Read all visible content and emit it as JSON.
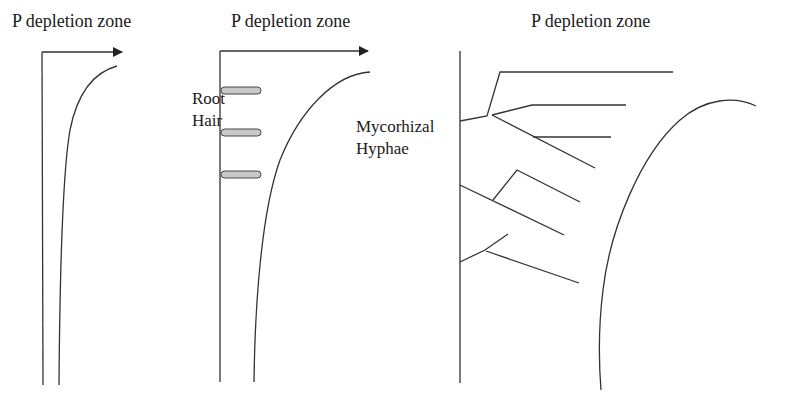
{
  "panels": [
    {
      "title": "P depletion zone",
      "side_label": []
    },
    {
      "title": "P depletion zone",
      "side_label": [
        "Root",
        "Hair"
      ]
    },
    {
      "title": "P depletion zone",
      "side_label": [
        "Mycorhizal",
        "Hyphae"
      ]
    }
  ],
  "colors": {
    "line": "#333333",
    "root_hair_fill": "#c8c8c8",
    "background": "#ffffff"
  }
}
